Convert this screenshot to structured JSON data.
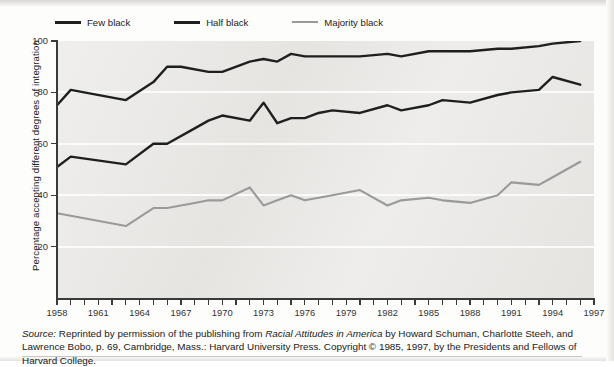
{
  "legend": {
    "position": "top-left",
    "items": [
      {
        "label": "Few black",
        "color": "#1f1f1f",
        "weight": "thick"
      },
      {
        "label": "Half black",
        "color": "#1f1f1f",
        "weight": "thick"
      },
      {
        "label": "Majority black",
        "color": "#9a9a9a",
        "weight": "thin"
      }
    ]
  },
  "axes": {
    "y_title": "Percentage accepting different degrees of integration",
    "y_ticks": [
      "20",
      "40",
      "60",
      "80",
      "100"
    ],
    "x_ticks_labeled": [
      "1958",
      "1961",
      "1964",
      "1967",
      "1970",
      "1973",
      "1976",
      "1979",
      "1982",
      "1985",
      "1988",
      "1991",
      "1994",
      "1997"
    ]
  },
  "caption": {
    "source_word": "Source:",
    "text_1": " Reprinted by permission of the publishing from ",
    "italic_1": "Racial Attitudes in America",
    "text_2": " by Howard Schuman, Charlotte Steeh, and Lawrence Bobo, p. 69, Cambridge, Mass.: Harvard University Press. Copyright © 1985, 1997, by the Presidents and Fellows of Harvard College."
  },
  "colors": {
    "plot_background": "#e9e8e5",
    "gridline": "#fbfbfa",
    "axis": "#3a3a3a",
    "few_black": "#1f1f1f",
    "half_black": "#1f1f1f",
    "majority_black": "#9a9a9a",
    "page_background": "#fdfdfc"
  },
  "chart_data": {
    "type": "line",
    "title": "",
    "xlabel": "",
    "ylabel": "Percentage accepting different degrees of integration",
    "xlim": [
      1958,
      1997
    ],
    "ylim": [
      0,
      100
    ],
    "ytick_values": [
      20,
      40,
      60,
      80,
      100
    ],
    "grid": "horizontal",
    "legend_position": "top-left",
    "x": [
      1958,
      1959,
      1960,
      1961,
      1962,
      1963,
      1964,
      1965,
      1966,
      1967,
      1968,
      1969,
      1970,
      1971,
      1972,
      1973,
      1974,
      1975,
      1976,
      1977,
      1978,
      1979,
      1980,
      1981,
      1982,
      1983,
      1984,
      1985,
      1986,
      1987,
      1988,
      1989,
      1990,
      1991,
      1992,
      1993,
      1994,
      1995,
      1996
    ],
    "series": [
      {
        "name": "Few black",
        "color": "#1f1f1f",
        "x": [
          1958,
          1959,
          1963,
          1965,
          1966,
          1967,
          1969,
          1970,
          1972,
          1973,
          1974,
          1975,
          1976,
          1977,
          1978,
          1980,
          1982,
          1983,
          1985,
          1986,
          1988,
          1990,
          1991,
          1993,
          1994,
          1996
        ],
        "values": [
          75,
          81,
          77,
          84,
          90,
          90,
          88,
          88,
          92,
          93,
          92,
          95,
          94,
          94,
          94,
          94,
          95,
          94,
          96,
          96,
          96,
          97,
          97,
          98,
          99,
          100
        ]
      },
      {
        "name": "Half black",
        "color": "#1f1f1f",
        "x": [
          1958,
          1959,
          1963,
          1965,
          1966,
          1968,
          1969,
          1970,
          1972,
          1973,
          1974,
          1975,
          1976,
          1977,
          1978,
          1980,
          1982,
          1983,
          1985,
          1986,
          1988,
          1990,
          1991,
          1993,
          1994,
          1996
        ],
        "values": [
          51,
          55,
          52,
          60,
          60,
          66,
          69,
          71,
          69,
          76,
          68,
          70,
          70,
          72,
          73,
          72,
          75,
          73,
          75,
          77,
          76,
          79,
          80,
          81,
          86,
          83
        ]
      },
      {
        "name": "Majority black",
        "color": "#9a9a9a",
        "x": [
          1958,
          1959,
          1963,
          1965,
          1966,
          1968,
          1969,
          1970,
          1972,
          1973,
          1974,
          1975,
          1976,
          1977,
          1978,
          1980,
          1982,
          1983,
          1985,
          1986,
          1988,
          1990,
          1991,
          1993,
          1994,
          1996
        ],
        "values": [
          33,
          32,
          28,
          35,
          35,
          37,
          38,
          38,
          43,
          36,
          38,
          40,
          38,
          39,
          40,
          42,
          36,
          38,
          39,
          38,
          37,
          40,
          45,
          44,
          47,
          53
        ]
      }
    ]
  }
}
